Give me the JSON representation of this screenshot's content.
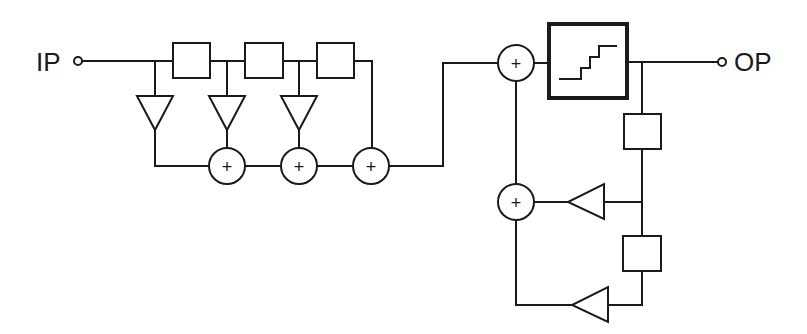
{
  "diagram": {
    "type": "block-diagram",
    "input_label": "IP",
    "output_label": "OP",
    "summer_symbol": "+",
    "fir_section": {
      "delay_blocks": 3,
      "gain_blocks": 3,
      "summers": 3
    },
    "quantizer": {
      "icon": "staircase-icon"
    },
    "feedback_section": {
      "delay_blocks": 2,
      "gain_blocks": 2,
      "summers": 2
    },
    "colors": {
      "line": "#1a1a1a",
      "background": "#ffffff"
    }
  }
}
